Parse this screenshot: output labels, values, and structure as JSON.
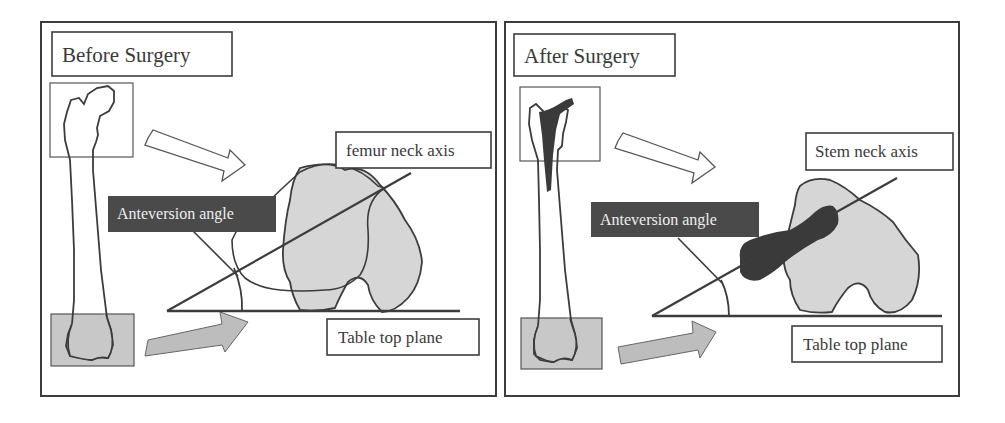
{
  "colors": {
    "ink": "#3c3c3c",
    "bone_fill": "#d6d6d6",
    "box_fill": "#c8c8c8",
    "dark": "#4a4a4a",
    "stem": "#3a3a3a",
    "paper": "#ffffff"
  },
  "panels": [
    {
      "id": "before",
      "title": "Before Surgery",
      "labels": {
        "axis": "femur neck axis",
        "angle": "Anteversion angle",
        "plane": "Table top plane"
      }
    },
    {
      "id": "after",
      "title": "After Surgery",
      "labels": {
        "axis": "Stem neck axis",
        "angle": "Anteversion angle",
        "plane": "Table top plane"
      }
    }
  ]
}
